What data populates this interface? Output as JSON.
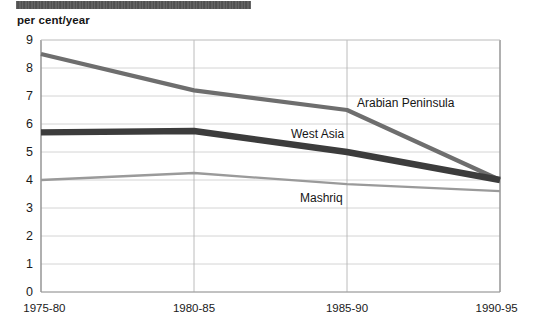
{
  "header": {
    "band_label": "",
    "band_color": "#3a3a3a"
  },
  "axis": {
    "unit_label": "per cent/year"
  },
  "chart_data": {
    "type": "line",
    "title": "",
    "subtitle": "",
    "xlabel": "",
    "ylabel": "per cent/year",
    "categories": [
      "1975-80",
      "1980-85",
      "1985-90",
      "1990-95"
    ],
    "ylim": [
      0,
      9
    ],
    "yticks": [
      0,
      1,
      2,
      3,
      4,
      5,
      6,
      7,
      8,
      9
    ],
    "ytick_labels": [
      "0",
      "1",
      "2",
      "3",
      "4",
      "5",
      "6",
      "7",
      "8",
      "9"
    ],
    "grid": true,
    "grid_axis": "both",
    "legend": "inline-annotations",
    "series": [
      {
        "name": "Arabian Peninsula",
        "values": [
          8.5,
          7.2,
          6.5,
          4.0
        ],
        "color": "#6e6e6e",
        "width": 4.2,
        "label_x": 357,
        "label_y": 96
      },
      {
        "name": "West Asia",
        "values": [
          5.7,
          5.75,
          5.0,
          4.0
        ],
        "color": "#3c3c3c",
        "width": 6.4,
        "label_x": 291,
        "label_y": 127
      },
      {
        "name": "Mashriq",
        "values": [
          4.0,
          4.25,
          3.85,
          3.6
        ],
        "color": "#9a9a9a",
        "width": 2.3,
        "label_x": 300,
        "label_y": 191
      }
    ],
    "annotations": [
      {
        "text": "Arabian Peninsula"
      },
      {
        "text": "West Asia"
      },
      {
        "text": "Mashriq"
      }
    ]
  }
}
